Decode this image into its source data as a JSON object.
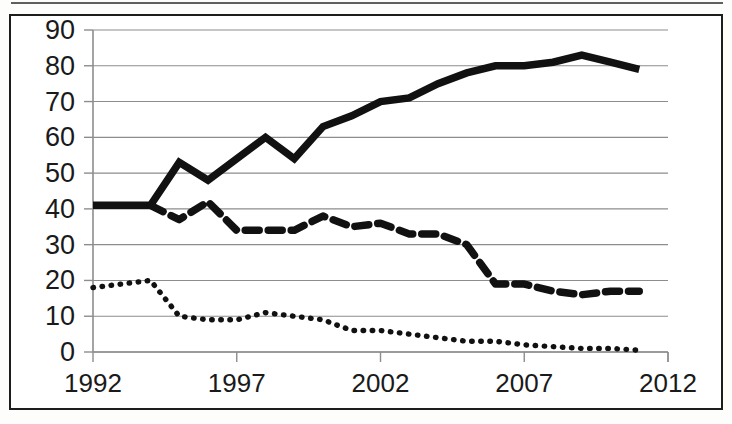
{
  "figure": {
    "name": "line-chart-three-series",
    "background_color": "#ffffff",
    "frame_color": "#1d1d1d",
    "series_color": "#111111",
    "gridline_color": "#8d8d8d"
  },
  "chart_data": {
    "type": "line",
    "title": "",
    "subtitle": "",
    "xlabel": "",
    "ylabel": "",
    "xlim": [
      1992,
      2012
    ],
    "ylim": [
      0,
      90
    ],
    "grid": true,
    "grid_axis": "y",
    "legend": false,
    "legend_position": "none",
    "ytick_labels": [
      "90",
      "80",
      "70",
      "60",
      "50",
      "40",
      "30",
      "20",
      "10",
      "0"
    ],
    "yticks": [
      90,
      80,
      70,
      60,
      50,
      40,
      30,
      20,
      10,
      0
    ],
    "xtick_labels": [
      "1992",
      "1997",
      "2002",
      "2007",
      "2012"
    ],
    "xticks": [
      1992,
      1997,
      2002,
      2007,
      2012
    ],
    "x": [
      1992,
      1993,
      1994,
      1995,
      1996,
      1997,
      1998,
      1999,
      2000,
      2001,
      2002,
      2003,
      2004,
      2005,
      2006,
      2007,
      2008,
      2009,
      2010,
      2011
    ],
    "series": [
      {
        "name": "series-solid",
        "style": "solid",
        "values": [
          41,
          41,
          41,
          53,
          48,
          54,
          60,
          54,
          63,
          66,
          70,
          71,
          75,
          78,
          80,
          80,
          81,
          83,
          81,
          79
        ]
      },
      {
        "name": "series-dashed",
        "style": "dashed",
        "values": [
          null,
          null,
          41,
          37,
          42,
          34,
          34,
          34,
          38,
          35,
          36,
          33,
          33,
          30,
          19,
          19,
          17,
          16,
          17,
          17
        ]
      },
      {
        "name": "series-dotted",
        "style": "dotted",
        "values": [
          18,
          19,
          20,
          10,
          9,
          9,
          11,
          10,
          9,
          6,
          6,
          5,
          4,
          3,
          3,
          2,
          1.5,
          1,
          1,
          0.5
        ]
      }
    ]
  }
}
